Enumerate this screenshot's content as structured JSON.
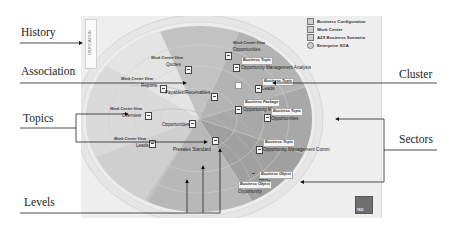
{
  "annotations": {
    "history": "History",
    "association": "Association",
    "topics": "Topics",
    "levels": "Levels",
    "cluster": "Cluster",
    "sectors": "Sectors"
  },
  "history_panel": {
    "label": "UNIFICATION"
  },
  "legend": [
    {
      "label": "Business Configuration",
      "icon": "square"
    },
    {
      "label": "Work Center",
      "icon": "square"
    },
    {
      "label": "A2X Business Scenario",
      "icon": "square"
    },
    {
      "label": "Enterprise SOA",
      "icon": "circle"
    }
  ],
  "nodes": [
    {
      "type": "Work Center View",
      "name": "Quotes"
    },
    {
      "type": "Work Center View",
      "name": "Opportunities"
    },
    {
      "type": "Work Center View",
      "name": "Reports"
    },
    {
      "type": "",
      "name": "Payables/Receivables"
    },
    {
      "type": "Work Center View",
      "name": "Overview"
    },
    {
      "type": "",
      "name": "Opportunities"
    },
    {
      "type": "Work Center View",
      "name": "Leads"
    },
    {
      "type": "",
      "name": "Presales Standard"
    },
    {
      "type": "Business Topic",
      "name": "Opportunity Management Analysis"
    },
    {
      "type": "Business Topic",
      "name": "Leads"
    },
    {
      "type": "Business Package",
      "name": "Opportunity Management"
    },
    {
      "type": "Business Topic",
      "name": "Opportunities"
    },
    {
      "type": "Business Topic",
      "name": "Opportunity Management Comm"
    },
    {
      "type": "Business Object",
      "name": "RFQs"
    },
    {
      "type": "Business Object",
      "name": "Opportunity"
    }
  ],
  "logo": {
    "label": "ISD"
  },
  "colors": {
    "sector_dark": "#a3a3a3",
    "sector_mid": "#bdbdbd",
    "ring": "#e3e3e3",
    "background": "#eeeeee"
  }
}
